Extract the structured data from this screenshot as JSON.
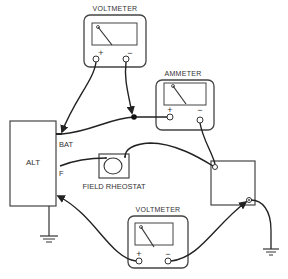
{
  "diagram": {
    "components": {
      "voltmeter_top": {
        "label": "VOLTMETER",
        "plus": "+",
        "minus": "−"
      },
      "ammeter": {
        "label": "AMMETER",
        "plus": "+",
        "minus": "−"
      },
      "alternator": {
        "label": "ALT",
        "terminal_bat": "BAT",
        "terminal_f": "F"
      },
      "field_rheostat": {
        "label": "FIELD RHEOSTAT"
      },
      "voltmeter_bottom": {
        "label": "VOLTMETER",
        "plus": "+",
        "minus": "−"
      },
      "battery_box": {
        "label": ""
      }
    },
    "colors": {
      "line": "#222222",
      "box": "#444444",
      "text": "#333333",
      "background": "#ffffff"
    }
  }
}
